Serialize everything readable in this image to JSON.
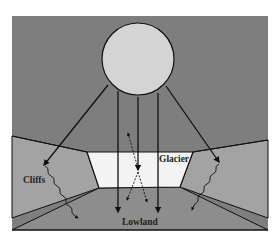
{
  "diagram": {
    "labels": {
      "glacier": "Glacier",
      "cliffs": "Cliffs",
      "lowland": "Lowland"
    },
    "elements": {
      "sun": "sun-circle",
      "direct_rays": 4,
      "oblique_rays": 2,
      "reflected_dashed_rays": 3,
      "wavy_longwave_emissions": 2
    },
    "colors": {
      "sky": "#7e7e7e",
      "sun": "#d6d6d6",
      "cliffs": "#a6a6a6",
      "glacier": "#f4f4f4",
      "lowland": "#8c8c8c",
      "upper_slope": "#858585",
      "outline": "#111111"
    }
  }
}
